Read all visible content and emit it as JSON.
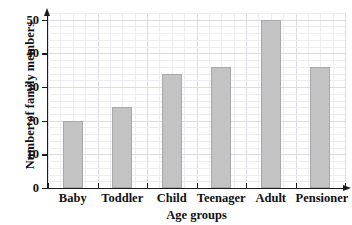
{
  "chart_data": {
    "type": "bar",
    "title": "",
    "categories": [
      "Baby",
      "Toddler",
      "Child",
      "Teenager",
      "Adult",
      "Pensioner"
    ],
    "values": [
      20,
      24,
      34,
      36,
      50,
      36
    ],
    "xlabel": "Age groups",
    "ylabel": "Number of family members",
    "ylim": [
      0,
      52
    ],
    "yticks": [
      0,
      10,
      20,
      30,
      40,
      50
    ],
    "ytick_labels": [
      "0",
      "10",
      "20",
      "30",
      "40",
      "50"
    ],
    "grid": true,
    "grid_minor_step": 2,
    "grid_major_step": 10,
    "legend": "none",
    "bar_color": "#c3c3c3",
    "bar_border_color": "#a8a8a8",
    "axis_color": "#1a1a1a",
    "grid_minor_color": "#ededf2",
    "grid_major_color": "#dcdce4",
    "background_color": "#ffffff"
  }
}
